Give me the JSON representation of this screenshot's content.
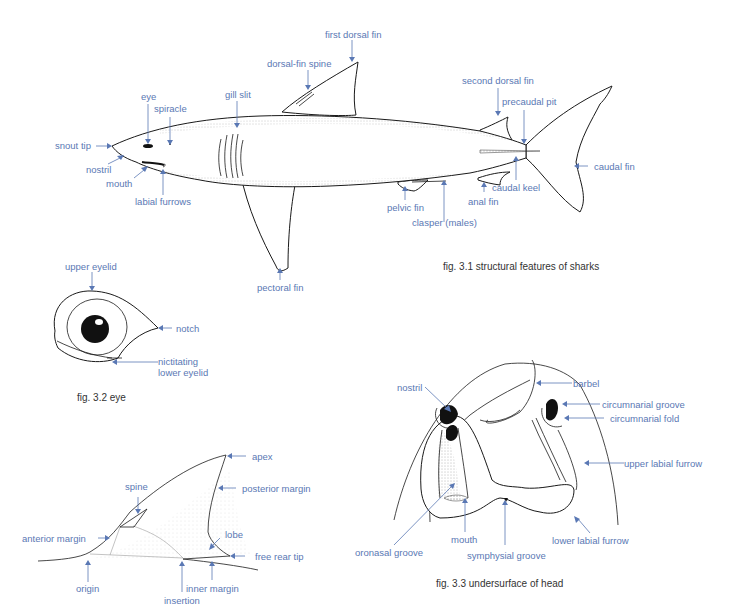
{
  "colors": {
    "label": "#5a78b4",
    "caption": "#333333",
    "line": "#1a1a1a"
  },
  "fig31": {
    "caption": "fig. 3.1  structural features of sharks",
    "labels": {
      "first_dorsal_fin": "first dorsal fin",
      "dorsal_fin_spine": "dorsal-fin spine",
      "gill_slit": "gill slit",
      "eye": "eye",
      "spiracle": "spiracle",
      "snout_tip": "snout tip",
      "nostril": "nostril",
      "mouth": "mouth",
      "labial_furrows": "labial furrows",
      "pectoral_fin": "pectoral fin",
      "second_dorsal_fin": "second dorsal fin",
      "precaudal_pit": "precaudal pit",
      "caudal_fin": "caudal fin",
      "caudal_keel": "caudal keel",
      "anal_fin": "anal fin",
      "pelvic_fin": "pelvic fin",
      "clasper": "clasper (males)"
    }
  },
  "fig32": {
    "caption": "fig. 3.2  eye",
    "labels": {
      "upper_eyelid": "upper eyelid",
      "notch": "notch",
      "nictitating_1": "nictitating",
      "nictitating_2": "lower eyelid"
    }
  },
  "fig_fin": {
    "labels": {
      "apex": "apex",
      "spine": "spine",
      "posterior_margin": "posterior margin",
      "anterior_margin": "anterior margin",
      "lobe": "lobe",
      "free_rear_tip": "free rear tip",
      "origin": "origin",
      "inner_margin": "inner margin",
      "insertion": "insertion"
    }
  },
  "fig33": {
    "caption": "fig. 3.3  undersurface of head",
    "labels": {
      "nostril": "nostril",
      "barbel": "barbel",
      "circumnarial_groove": "circumnarial groove",
      "circumnarial_fold": "circumnarial fold",
      "upper_labial_furrow": "upper labial furrow",
      "lower_labial_furrow": "lower labial furrow",
      "oronasal_groove": "oronasal groove",
      "mouth": "mouth",
      "symphysial_groove": "symphysial groove"
    }
  }
}
